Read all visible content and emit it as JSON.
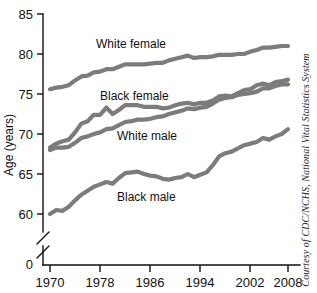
{
  "chart_data": {
    "type": "line",
    "title": "",
    "xlabel": "",
    "ylabel": "Age (years)",
    "xlim": [
      1970,
      2008
    ],
    "ylim": [
      58,
      85
    ],
    "grid": false,
    "legend_position": "inline-labels",
    "xticks": [
      "1970",
      "1978",
      "1986",
      "1994",
      "2002",
      "2008"
    ],
    "xtick_values": [
      1970,
      1978,
      1986,
      1994,
      2002,
      2008
    ],
    "yticks": [
      "0",
      "60",
      "65",
      "70",
      "75",
      "80",
      "85"
    ],
    "ytick_values": [
      0,
      60,
      65,
      70,
      75,
      80,
      85
    ],
    "y_axis_break": true,
    "y_axis_break_note": "axis broken between 0 and 60",
    "line_color": "#7c7c7c",
    "x": [
      1970,
      1971,
      1972,
      1973,
      1974,
      1975,
      1976,
      1977,
      1978,
      1979,
      1980,
      1981,
      1982,
      1983,
      1984,
      1985,
      1986,
      1987,
      1988,
      1989,
      1990,
      1991,
      1992,
      1993,
      1994,
      1995,
      1996,
      1997,
      1998,
      1999,
      2000,
      2001,
      2002,
      2003,
      2004,
      2005,
      2006,
      2007,
      2008
    ],
    "series": [
      {
        "name": "White female",
        "label": "White female",
        "values": [
          75.6,
          75.8,
          75.9,
          76.1,
          76.7,
          77.2,
          77.3,
          77.7,
          77.8,
          78.1,
          78.1,
          78.4,
          78.7,
          78.7,
          78.7,
          78.7,
          78.8,
          78.9,
          78.9,
          79.2,
          79.4,
          79.6,
          79.8,
          79.5,
          79.6,
          79.6,
          79.7,
          79.9,
          79.9,
          79.9,
          80.0,
          80.0,
          80.3,
          80.5,
          80.8,
          80.8,
          80.9,
          81.0,
          81.0
        ]
      },
      {
        "name": "Black female",
        "label": "Black female",
        "values": [
          68.3,
          68.8,
          69.1,
          69.3,
          70.2,
          71.3,
          71.6,
          72.4,
          72.4,
          73.3,
          72.5,
          73.0,
          73.6,
          73.6,
          73.6,
          73.4,
          73.4,
          73.4,
          73.2,
          73.3,
          73.6,
          73.8,
          73.9,
          73.7,
          73.9,
          73.9,
          74.2,
          74.7,
          74.8,
          74.7,
          75.1,
          75.5,
          75.6,
          76.1,
          76.3,
          76.1,
          76.5,
          76.6,
          76.8
        ]
      },
      {
        "name": "White male",
        "label": "White male",
        "values": [
          68.0,
          68.3,
          68.3,
          68.4,
          68.9,
          69.5,
          69.7,
          70.0,
          70.2,
          70.6,
          70.7,
          71.1,
          71.5,
          71.6,
          71.8,
          71.8,
          71.9,
          72.1,
          72.2,
          72.5,
          72.7,
          72.9,
          73.2,
          73.1,
          73.3,
          73.4,
          73.8,
          74.3,
          74.5,
          74.6,
          74.9,
          75.0,
          75.1,
          75.3,
          75.7,
          75.7,
          76.0,
          76.2,
          76.2
        ]
      },
      {
        "name": "Black male",
        "label": "Black male",
        "values": [
          60.0,
          60.5,
          60.4,
          60.9,
          61.7,
          62.4,
          62.9,
          63.4,
          63.7,
          64.0,
          63.8,
          64.5,
          65.1,
          65.2,
          65.3,
          65.0,
          64.8,
          64.7,
          64.4,
          64.3,
          64.5,
          64.6,
          65.0,
          64.6,
          64.9,
          65.2,
          66.1,
          67.2,
          67.6,
          67.8,
          68.2,
          68.6,
          68.8,
          69.0,
          69.5,
          69.3,
          69.7,
          70.0,
          70.6
        ]
      }
    ]
  },
  "axis": {
    "y_title": "Age (years)"
  },
  "credit": {
    "text": "Courtesy of CDC/NCHS, National Vital Statistics System"
  }
}
